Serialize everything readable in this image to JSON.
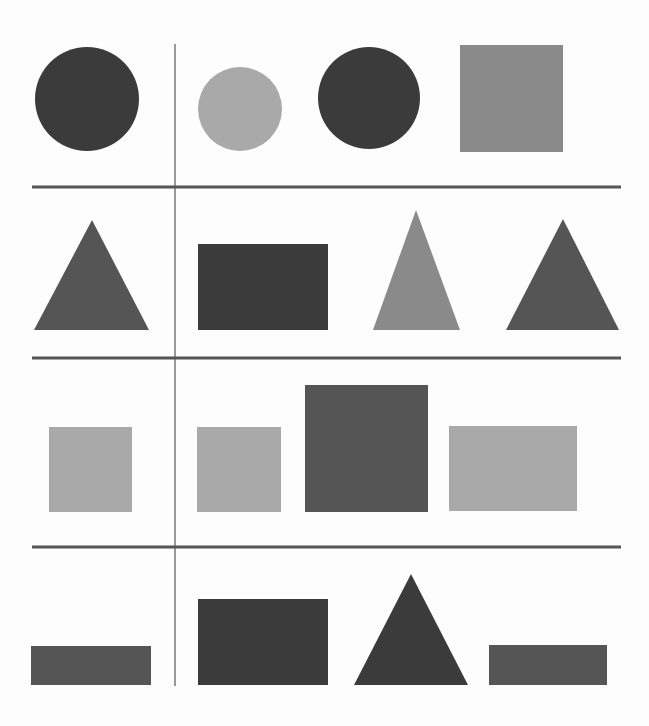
{
  "colors": {
    "background": "#fdfdfd",
    "dark": "#3b3b3b",
    "medium_dark": "#555555",
    "medium": "#8a8a8a",
    "light": "#a9a9a9",
    "horizontal_divider": "#555555",
    "vertical_divider": "#9a9a9a"
  },
  "dividers": {
    "vertical": {
      "x": 175,
      "y1": 44,
      "y2": 686,
      "width": 2
    },
    "horizontal": [
      {
        "y": 187,
        "x1": 32,
        "x2": 621,
        "width": 3
      },
      {
        "y": 358,
        "x1": 32,
        "x2": 621,
        "width": 3
      },
      {
        "y": 547,
        "x1": 32,
        "x2": 621,
        "width": 3
      }
    ]
  },
  "rows": [
    {
      "name": "row-1",
      "shapes": [
        {
          "type": "circle",
          "shade": "dark",
          "cx": 87,
          "cy": 99,
          "r": 52
        },
        {
          "type": "circle",
          "shade": "light",
          "cx": 240,
          "cy": 109,
          "r": 42
        },
        {
          "type": "circle",
          "shade": "dark",
          "cx": 369,
          "cy": 98,
          "r": 51
        },
        {
          "type": "square",
          "shade": "medium",
          "x": 460,
          "y": 45,
          "w": 103,
          "h": 107
        }
      ]
    },
    {
      "name": "row-2",
      "shapes": [
        {
          "type": "triangle",
          "shade": "medium_dark",
          "points": [
            [
              92,
              220
            ],
            [
              149,
              330
            ],
            [
              34,
              330
            ]
          ]
        },
        {
          "type": "rectangle",
          "shade": "dark",
          "x": 198,
          "y": 244,
          "w": 130,
          "h": 86
        },
        {
          "type": "triangle",
          "shade": "medium",
          "points": [
            [
              416,
              210
            ],
            [
              460,
              330
            ],
            [
              373,
              330
            ]
          ]
        },
        {
          "type": "triangle",
          "shade": "medium_dark",
          "points": [
            [
              563,
              219
            ],
            [
              619,
              330
            ],
            [
              506,
              330
            ]
          ]
        }
      ]
    },
    {
      "name": "row-3",
      "shapes": [
        {
          "type": "square",
          "shade": "light",
          "x": 49,
          "y": 427,
          "w": 83,
          "h": 85
        },
        {
          "type": "square",
          "shade": "light",
          "x": 197,
          "y": 427,
          "w": 84,
          "h": 85
        },
        {
          "type": "square",
          "shade": "medium_dark",
          "x": 305,
          "y": 385,
          "w": 123,
          "h": 127
        },
        {
          "type": "rectangle",
          "shade": "light",
          "x": 449,
          "y": 426,
          "w": 128,
          "h": 85
        }
      ]
    },
    {
      "name": "row-4",
      "shapes": [
        {
          "type": "rectangle",
          "shade": "medium_dark",
          "x": 31,
          "y": 646,
          "w": 120,
          "h": 39
        },
        {
          "type": "rectangle",
          "shade": "dark",
          "x": 198,
          "y": 599,
          "w": 130,
          "h": 86
        },
        {
          "type": "triangle",
          "shade": "dark",
          "points": [
            [
              411,
              574
            ],
            [
              468,
              685
            ],
            [
              354,
              685
            ]
          ]
        },
        {
          "type": "rectangle",
          "shade": "medium_dark",
          "x": 489,
          "y": 645,
          "w": 118,
          "h": 40
        }
      ]
    }
  ]
}
